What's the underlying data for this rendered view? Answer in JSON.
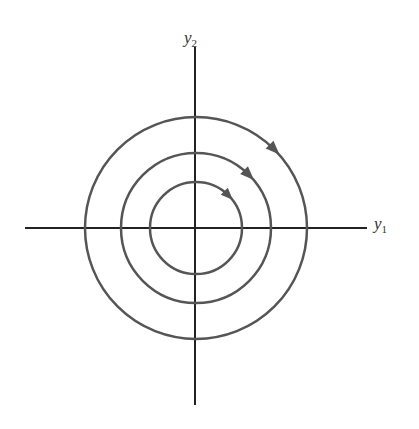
{
  "diagram": {
    "type": "phase-portrait",
    "axes": {
      "x_label": {
        "base": "y",
        "sub": "1"
      },
      "y_label": {
        "base": "y",
        "sub": "2"
      }
    },
    "orbits": [
      {
        "radius": 46,
        "direction": "clockwise"
      },
      {
        "radius": 75,
        "direction": "clockwise"
      },
      {
        "radius": 111,
        "direction": "clockwise"
      }
    ],
    "colors": {
      "axis": "#222222",
      "orbit": "#555555",
      "arrow": "#555555"
    }
  }
}
